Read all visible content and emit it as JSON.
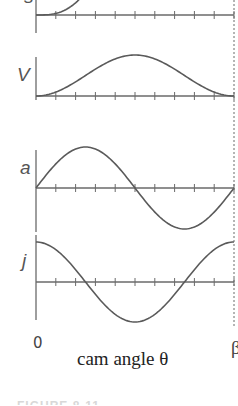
{
  "chart_data": {
    "type": "line",
    "title": "",
    "xlabel": "cam angle θ",
    "x_ticks": [
      "0",
      "β"
    ],
    "x_range": [
      0,
      1
    ],
    "num_minor_ticks": 10,
    "grid": false,
    "legend": "none",
    "end_marker": "dotted vertical line at θ = β",
    "x": [
      0,
      0.1,
      0.2,
      0.3,
      0.4,
      0.5,
      0.6,
      0.7,
      0.8,
      0.9,
      1.0
    ],
    "series": [
      {
        "name": "s",
        "label": "s",
        "description": "displacement (cycloidal rise)",
        "values": [
          0,
          0.004,
          0.03,
          0.091,
          0.176,
          0.5,
          0.824,
          0.909,
          0.97,
          0.996,
          1.0
        ]
      },
      {
        "name": "v",
        "label": "V",
        "description": "velocity",
        "values": [
          0,
          0.095,
          0.345,
          0.655,
          0.905,
          1.0,
          0.905,
          0.655,
          0.345,
          0.095,
          0
        ]
      },
      {
        "name": "a",
        "label": "a",
        "description": "acceleration",
        "values": [
          0,
          0.588,
          0.951,
          0.951,
          0.588,
          0,
          -0.588,
          -0.951,
          -0.951,
          -0.588,
          0
        ]
      },
      {
        "name": "j",
        "label": "j",
        "description": "jerk",
        "values": [
          1.0,
          0.809,
          0.309,
          -0.309,
          -0.809,
          -1.0,
          -0.809,
          -0.309,
          0.309,
          0.809,
          1.0
        ]
      }
    ]
  },
  "labels": {
    "s": "s",
    "v": "V",
    "a": "a",
    "j": "j",
    "x_start": "0",
    "x_end": "β",
    "xlabel": "cam angle θ",
    "caption": "FIGURE 8-11"
  }
}
